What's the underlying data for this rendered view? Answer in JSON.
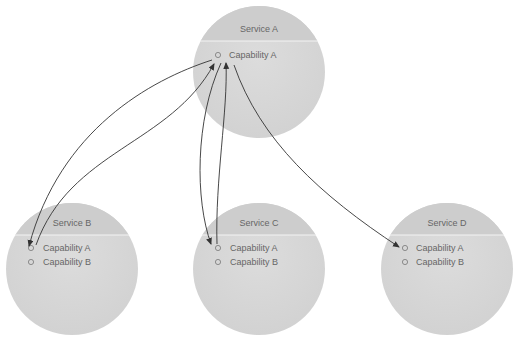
{
  "diagram": {
    "services": [
      {
        "id": "A",
        "title": "Service A",
        "cx": 259,
        "cy": 72,
        "r": 66,
        "capabilities": [
          "Capability A"
        ]
      },
      {
        "id": "B",
        "title": "Service B",
        "cx": 72,
        "cy": 269,
        "r": 66,
        "capabilities": [
          "Capability A",
          "Capability B"
        ]
      },
      {
        "id": "C",
        "title": "Service C",
        "cx": 259,
        "cy": 269,
        "r": 66,
        "capabilities": [
          "Capability A",
          "Capability B"
        ]
      },
      {
        "id": "D",
        "title": "Service D",
        "cx": 447,
        "cy": 269,
        "r": 66,
        "capabilities": [
          "Capability A",
          "Capability B"
        ]
      }
    ],
    "connections": [
      {
        "from": "A.Capability A",
        "to": "B.Capability A"
      },
      {
        "from": "B.Capability A",
        "to": "A.Capability A"
      },
      {
        "from": "A.Capability A",
        "to": "C.Capability A"
      },
      {
        "from": "C.Capability A",
        "to": "A.Capability A"
      },
      {
        "from": "A.Capability A",
        "to": "D.Capability A"
      }
    ],
    "colors": {
      "circle_top": "#cfcfcf",
      "circle_body": "#d9d9d9",
      "divider": "#f2f2f2",
      "text": "#666666",
      "arrow": "#333333"
    }
  }
}
